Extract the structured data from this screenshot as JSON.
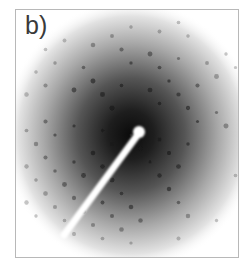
{
  "figure": {
    "panel_label": "b)",
    "content": "electron diffraction pattern",
    "colors": {
      "background": "#ffffff",
      "border": "#b8b8b8",
      "halo_core": "#111111",
      "spot": "#1a1a1a",
      "beam_stop": "#ffffff",
      "label": "#3a3a3a"
    }
  }
}
